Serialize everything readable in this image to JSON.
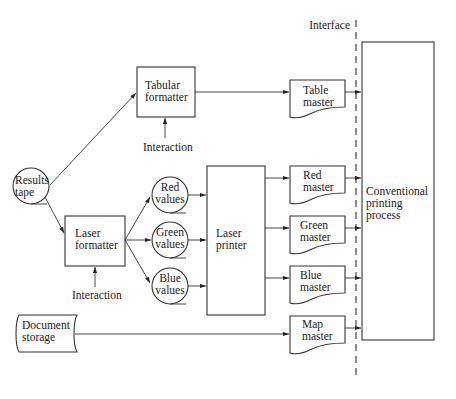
{
  "diagram": {
    "interface_label": "Interface",
    "nodes": {
      "results_tape": [
        "Results",
        "tape"
      ],
      "tabular_formatter": [
        "Tabular",
        "formatter"
      ],
      "laser_formatter": [
        "Laser",
        "formatter"
      ],
      "red_values": [
        "Red",
        "values"
      ],
      "green_values": [
        "Green",
        "values"
      ],
      "blue_values": [
        "Blue",
        "values"
      ],
      "laser_printer": [
        "Laser",
        "printer"
      ],
      "table_master": [
        "Table",
        "master"
      ],
      "red_master": [
        "Red",
        "master"
      ],
      "green_master": [
        "Green",
        "master"
      ],
      "blue_master": [
        "Blue",
        "master"
      ],
      "map_master": [
        "Map",
        "master"
      ],
      "document_storage": [
        "Document",
        "storage"
      ],
      "conventional_printing": [
        "Conventional",
        "printing",
        "process"
      ]
    },
    "interaction_labels": {
      "tabular": "Interaction",
      "laser": "Interaction"
    },
    "edges": [
      [
        "Results tape",
        "Tabular formatter"
      ],
      [
        "Results tape",
        "Laser formatter"
      ],
      [
        "Tabular formatter",
        "Table master"
      ],
      [
        "Interaction",
        "Tabular formatter"
      ],
      [
        "Interaction",
        "Laser formatter"
      ],
      [
        "Laser formatter",
        "Red values"
      ],
      [
        "Laser formatter",
        "Green values"
      ],
      [
        "Laser formatter",
        "Blue values"
      ],
      [
        "Red values",
        "Laser printer"
      ],
      [
        "Green values",
        "Laser printer"
      ],
      [
        "Blue values",
        "Laser printer"
      ],
      [
        "Laser printer",
        "Red master"
      ],
      [
        "Laser printer",
        "Green master"
      ],
      [
        "Laser printer",
        "Blue master"
      ],
      [
        "Document storage",
        "Map master"
      ],
      [
        "Table master",
        "Conventional printing process"
      ],
      [
        "Red master",
        "Conventional printing process"
      ],
      [
        "Green master",
        "Conventional printing process"
      ],
      [
        "Blue master",
        "Conventional printing process"
      ],
      [
        "Map master",
        "Conventional printing process"
      ]
    ]
  }
}
